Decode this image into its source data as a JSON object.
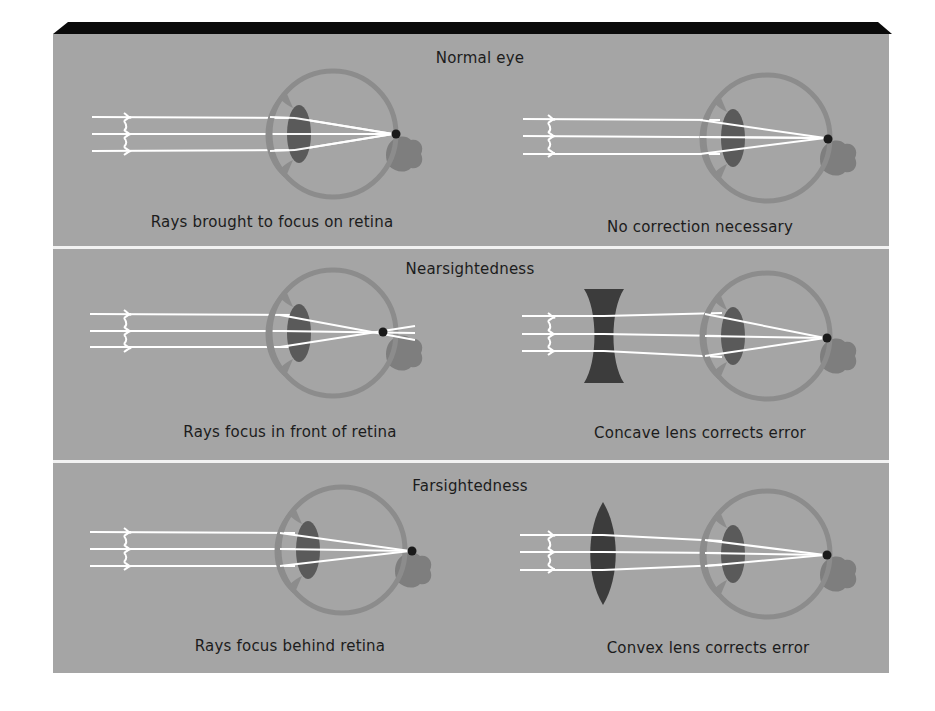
{
  "colors": {
    "background": "#ffffff",
    "panel": "#a5a5a5",
    "top_band": "#0a0a0a",
    "divider": "#f2f2f2",
    "eye_wall": "#8c8c8c",
    "eye_lens": "#5a5a5a",
    "optic_nerve": "#7e7e7e",
    "focus_dot": "#1a1a1a",
    "ray": "#ffffff",
    "corrective_lens": "#3c3c3c"
  },
  "rows": [
    {
      "title": "Normal eye",
      "left_caption": "Rays brought to focus on retina",
      "right_caption": "No correction necessary",
      "condition": "normal",
      "correction": "none"
    },
    {
      "title": "Nearsightedness",
      "left_caption": "Rays focus in front of retina",
      "right_caption": "Concave lens corrects error",
      "condition": "myopia",
      "correction": "concave"
    },
    {
      "title": "Farsightedness",
      "left_caption": "Rays focus behind retina",
      "right_caption": "Convex lens corrects error",
      "condition": "hyperopia",
      "correction": "convex"
    }
  ]
}
